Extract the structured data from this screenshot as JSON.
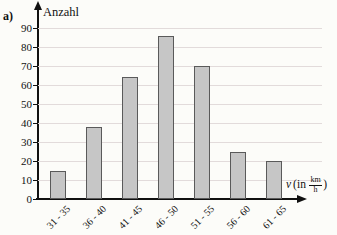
{
  "panel_label": "a)",
  "chart_data": {
    "type": "bar",
    "title": "",
    "ylabel": "Anzahl",
    "xlabel": "v (in km/h)",
    "xlabel_parts": {
      "variable": "v",
      "prefix": "(in",
      "frac_numerator": "km",
      "frac_denominator": "h",
      "suffix": ")"
    },
    "categories": [
      "31 - 35",
      "36 - 40",
      "41 - 45",
      "46 - 50",
      "51 - 55",
      "56 - 60",
      "61 - 65"
    ],
    "values": [
      15,
      38,
      64,
      86,
      70,
      25,
      20
    ],
    "ylim": [
      0,
      95
    ],
    "yticks": [
      0,
      10,
      20,
      30,
      40,
      50,
      60,
      70,
      80,
      90
    ],
    "grid": true,
    "legend": "none",
    "bar_color": "#c6c6c6",
    "bar_border_color": "#5a5a5a",
    "grid_color": "#e2dbdb",
    "axis_color": "#111111",
    "background_color": "#fcfcf9"
  }
}
